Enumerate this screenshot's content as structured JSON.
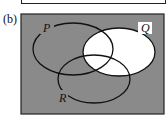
{
  "part_label": "(b)",
  "sets": [
    {
      "name": "P"
    },
    {
      "name": "Q"
    },
    {
      "name": "R"
    }
  ],
  "shading": {
    "shaded_color": "#8a8a8a",
    "unshaded_color": "#ffffff",
    "unshaded_region": "Q",
    "shaded_region": "Q' (complement of Q)"
  }
}
